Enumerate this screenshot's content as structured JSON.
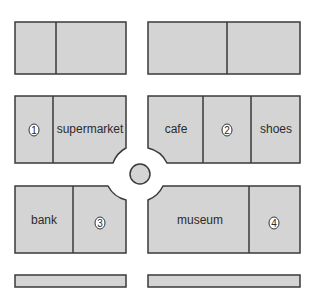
{
  "map": {
    "title": "",
    "colors": {
      "block_fill": "#d4d4d4",
      "outline": "#3a3a3a",
      "background": "#ffffff"
    },
    "labels": {
      "supermarket": "supermarket",
      "cafe": "cafe",
      "shoes": "shoes",
      "bank": "bank",
      "museum": "museum"
    },
    "markers": {
      "m1": "1",
      "m2": "2",
      "m3": "3",
      "m4": "4"
    },
    "roundabout": {
      "label": "roundabout"
    }
  }
}
